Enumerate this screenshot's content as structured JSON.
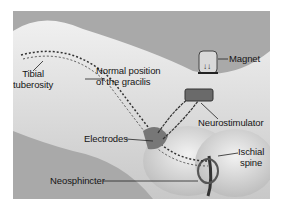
{
  "figure": {
    "labels": {
      "tibial_tuberosity": [
        "Tibial",
        "tuberosity"
      ],
      "gracilis": [
        "Normal position",
        "of the gracilis"
      ],
      "magnet": "Magnet",
      "neurostimulator": "Neurostimulator",
      "electrodes": "Electrodes",
      "ischial_spine": [
        "Ischial",
        "spine"
      ],
      "neosphincter": "Neosphincter"
    },
    "colors": {
      "background": "#a9a9a9",
      "skin_light": "#e6e6e6",
      "skin_mid": "#cfcfcf",
      "shadow": "#5a5a5a",
      "line": "#1e1e1e"
    }
  }
}
